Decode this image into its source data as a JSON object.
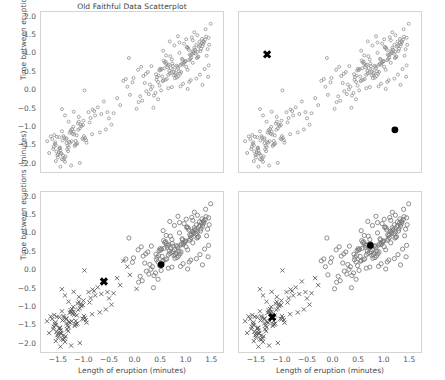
{
  "figure": {
    "title": "Old Faithful Data Scatterplot",
    "xlabel": "Length of eruption (minutes)",
    "ylabel": "Time between eruptions (minutes)"
  },
  "chart_data": {
    "type": "scatter",
    "title": "Old Faithful Data Scatterplot",
    "xlabel": "Length of eruption (minutes)",
    "ylabel": "Time between eruptions (minutes)",
    "xlim": [
      -1.85,
      1.75
    ],
    "ylim": [
      -2.25,
      2.15
    ],
    "xticks": [
      -1.5,
      -1.0,
      -0.5,
      0.0,
      0.5,
      1.0,
      1.5
    ],
    "yticks": [
      -2.0,
      -1.5,
      -1.0,
      -0.5,
      0.0,
      0.5,
      1.0,
      1.5,
      2.0
    ],
    "grid": false,
    "legend": "none",
    "layout": "2x2 small multiples (k-means progression)",
    "panels": [
      {
        "id": "panel-tl",
        "name": "raw-data",
        "show_xticklabels": false,
        "show_yticklabels": true,
        "title": "Old Faithful Data Scatterplot",
        "series": [
          {
            "name": "all points",
            "marker": "open-circle",
            "color": "#808080",
            "size": 2.0
          }
        ],
        "centroids": []
      },
      {
        "id": "panel-tr",
        "name": "initial-centroids",
        "show_xticklabels": false,
        "show_yticklabels": false,
        "series": [
          {
            "name": "all points",
            "marker": "open-circle",
            "color": "#808080",
            "size": 2.0
          }
        ],
        "centroids": [
          {
            "marker": "x",
            "color": "#000000",
            "x": -1.3,
            "y": 1.0
          },
          {
            "marker": "filled-circle",
            "color": "#000000",
            "x": 1.2,
            "y": -1.05
          }
        ]
      },
      {
        "id": "panel-bl",
        "name": "first-assignment",
        "show_xticklabels": true,
        "show_yticklabels": true,
        "series": [
          {
            "name": "cluster x",
            "marker": "x",
            "color": "#4d4d4d",
            "size": 2.6
          },
          {
            "name": "cluster o",
            "marker": "open-circle",
            "color": "#808080",
            "size": 2.6
          }
        ],
        "centroids": [
          {
            "marker": "x",
            "color": "#000000",
            "x": -0.62,
            "y": -0.28
          },
          {
            "marker": "filled-circle",
            "color": "#000000",
            "x": 0.5,
            "y": 0.18
          }
        ]
      },
      {
        "id": "panel-br",
        "name": "converged-clusters",
        "show_xticklabels": true,
        "show_yticklabels": false,
        "series": [
          {
            "name": "cluster x",
            "marker": "x",
            "color": "#4d4d4d",
            "size": 2.6
          },
          {
            "name": "cluster o",
            "marker": "open-circle",
            "color": "#808080",
            "size": 2.6
          }
        ],
        "centroids": [
          {
            "marker": "x",
            "color": "#000000",
            "x": -1.2,
            "y": -1.25
          },
          {
            "marker": "filled-circle",
            "color": "#000000",
            "x": 0.72,
            "y": 0.7
          }
        ]
      }
    ],
    "points": [
      [
        -1.49,
        -1.25
      ],
      [
        0.92,
        0.85
      ],
      [
        -0.36,
        -0.19
      ],
      [
        0.76,
        0.58
      ],
      [
        1.43,
        1.45
      ],
      [
        -0.97,
        -1.33
      ],
      [
        1.04,
        1.12
      ],
      [
        0.74,
        0.53
      ],
      [
        -1.51,
        -1.72
      ],
      [
        1.12,
        0.77
      ],
      [
        -1.35,
        -1.41
      ],
      [
        0.83,
        0.63
      ],
      [
        0.95,
        1.29
      ],
      [
        -1.48,
        -1.55
      ],
      [
        0.68,
        0.95
      ],
      [
        -1.2,
        -1.18
      ],
      [
        -1.44,
        -1.85
      ],
      [
        1.18,
        1.02
      ],
      [
        -1.55,
        -1.64
      ],
      [
        0.52,
        0.4
      ],
      [
        -1.41,
        -1.22
      ],
      [
        -1.33,
        -1.48
      ],
      [
        0.88,
        0.71
      ],
      [
        1.21,
        1.07
      ],
      [
        -1.02,
        -0.8
      ],
      [
        0.61,
        0.33
      ],
      [
        -1.38,
        -1.92
      ],
      [
        1.31,
        1.22
      ],
      [
        -1.57,
        -1.39
      ],
      [
        0.99,
        0.66
      ],
      [
        0.44,
        0.25
      ],
      [
        -1.12,
        -1.05
      ],
      [
        1.09,
        0.91
      ],
      [
        -1.46,
        -1.68
      ],
      [
        0.79,
        0.49
      ],
      [
        -0.67,
        -0.62
      ],
      [
        1.25,
        1.34
      ],
      [
        -1.29,
        -1.13
      ],
      [
        0.57,
        0.78
      ],
      [
        0.86,
        1.04
      ],
      [
        -1.52,
        -1.8
      ],
      [
        1.02,
        0.58
      ],
      [
        -1.18,
        -1.45
      ],
      [
        0.71,
        0.86
      ],
      [
        -1.4,
        -1.26
      ],
      [
        1.15,
        1.18
      ],
      [
        -1.07,
        -0.91
      ],
      [
        0.64,
        0.44
      ],
      [
        -1.61,
        -1.57
      ],
      [
        0.93,
        0.72
      ],
      [
        1.36,
        1.4
      ],
      [
        -1.25,
        -1.36
      ],
      [
        0.48,
        0.61
      ],
      [
        -1.44,
        -1.09
      ],
      [
        0.81,
        0.37
      ],
      [
        1.06,
        0.99
      ],
      [
        -1.53,
        -1.74
      ],
      [
        0.66,
        0.55
      ],
      [
        -0.88,
        -0.73
      ],
      [
        1.28,
        1.15
      ],
      [
        -1.31,
        -1.52
      ],
      [
        0.54,
        0.29
      ],
      [
        0.97,
        0.81
      ],
      [
        -1.15,
        -1.2
      ],
      [
        1.19,
        1.26
      ],
      [
        -1.47,
        -1.61
      ],
      [
        0.73,
        0.68
      ],
      [
        -1.22,
        -0.97
      ],
      [
        0.4,
        0.46
      ],
      [
        1.11,
        1.08
      ],
      [
        -1.58,
        -1.43
      ],
      [
        0.89,
        0.52
      ],
      [
        -1.04,
        -1.29
      ],
      [
        1.33,
        1.36
      ],
      [
        -1.37,
        -1.77
      ],
      [
        0.6,
        0.74
      ],
      [
        0.84,
        0.41
      ],
      [
        -1.26,
        -1.11
      ],
      [
        1.23,
        0.94
      ],
      [
        -1.5,
        -1.66
      ],
      [
        0.69,
        0.63
      ],
      [
        -0.92,
        -0.57
      ],
      [
        1.01,
        1.2
      ],
      [
        -1.43,
        -1.34
      ],
      [
        0.46,
        0.56
      ],
      [
        0.91,
        0.88
      ],
      [
        -1.19,
        -1.49
      ],
      [
        1.14,
        1.03
      ],
      [
        -1.54,
        -1.24
      ],
      [
        0.77,
        0.35
      ],
      [
        -1.09,
        -1.01
      ],
      [
        1.29,
        1.31
      ],
      [
        -1.34,
        -1.58
      ],
      [
        0.63,
        0.7
      ],
      [
        0.87,
        0.47
      ],
      [
        -1.23,
        -1.16
      ],
      [
        1.05,
        0.84
      ],
      [
        -1.45,
        -1.7
      ],
      [
        0.51,
        0.6
      ],
      [
        -0.79,
        -0.66
      ],
      [
        1.17,
        1.11
      ],
      [
        -1.3,
        -1.38
      ],
      [
        0.94,
        0.76
      ],
      [
        -1.13,
        -0.88
      ],
      [
        0.58,
        0.31
      ],
      [
        1.08,
        0.97
      ],
      [
        -1.56,
        -1.47
      ],
      [
        0.82,
        0.67
      ],
      [
        -1.01,
        -1.22
      ],
      [
        1.26,
        1.24
      ],
      [
        -1.39,
        -1.82
      ],
      [
        0.7,
        0.51
      ],
      [
        0.55,
        0.83
      ],
      [
        -1.27,
        -1.06
      ],
      [
        1.2,
        0.9
      ],
      [
        -1.48,
        -1.53
      ],
      [
        0.65,
        0.72
      ],
      [
        -0.84,
        -0.5
      ],
      [
        1.03,
        1.17
      ],
      [
        -1.36,
        -1.31
      ],
      [
        0.42,
        0.38
      ],
      [
        0.96,
        0.79
      ],
      [
        -1.16,
        -1.44
      ],
      [
        1.13,
        1.06
      ],
      [
        -1.59,
        -1.19
      ],
      [
        0.75,
        0.43
      ],
      [
        -1.06,
        -0.95
      ],
      [
        1.32,
        1.28
      ],
      [
        -1.32,
        -1.63
      ],
      [
        0.62,
        0.65
      ],
      [
        0.85,
        0.54
      ],
      [
        -1.21,
        -1.1
      ],
      [
        1.07,
        0.87
      ],
      [
        -1.42,
        -1.75
      ],
      [
        0.49,
        0.57
      ],
      [
        -0.74,
        -0.44
      ],
      [
        1.16,
        1.13
      ],
      [
        -1.28,
        -1.4
      ],
      [
        0.9,
        0.74
      ],
      [
        -1.11,
        -0.83
      ],
      [
        0.53,
        0.27
      ],
      [
        1.1,
        1.0
      ],
      [
        -1.6,
        -1.51
      ],
      [
        0.8,
        0.69
      ],
      [
        -0.99,
        -1.27
      ],
      [
        1.24,
        1.21
      ],
      [
        -1.41,
        -1.86
      ],
      [
        0.67,
        0.48
      ],
      [
        0.59,
        0.8
      ],
      [
        -1.24,
        -1.03
      ],
      [
        1.22,
        0.92
      ],
      [
        -1.49,
        -1.56
      ],
      [
        0.72,
        0.75
      ],
      [
        -0.81,
        -0.54
      ],
      [
        1.0,
        1.19
      ],
      [
        -1.35,
        -1.28
      ],
      [
        0.45,
        0.42
      ],
      [
        0.98,
        0.82
      ],
      [
        -1.14,
        -1.42
      ],
      [
        1.27,
        1.09
      ],
      [
        -1.03,
        -0.92
      ],
      [
        0.78,
        0.45
      ],
      [
        1.34,
        1.33
      ],
      [
        -1.17,
        -1.35
      ],
      [
        0.56,
        0.62
      ],
      [
        0.3,
        0.05
      ],
      [
        0.26,
        -0.08
      ],
      [
        0.18,
        0.22
      ],
      [
        -0.13,
        0.9
      ],
      [
        -0.11,
        -0.1
      ],
      [
        0.06,
        -0.3
      ],
      [
        -0.06,
        0.24
      ],
      [
        0.35,
        -0.45
      ],
      [
        -0.19,
        0.33
      ],
      [
        -0.55,
        -0.57
      ],
      [
        -0.62,
        -0.28
      ],
      [
        -1.0,
        0.02
      ],
      [
        -0.3,
        -0.38
      ],
      [
        0.13,
        -0.26
      ],
      [
        -0.43,
        -0.6
      ],
      [
        1.47,
        1.83
      ],
      [
        1.42,
        0.39
      ],
      [
        1.38,
        1.48
      ],
      [
        -1.63,
        -1.3
      ],
      [
        -1.26,
        -2.02
      ],
      [
        -1.09,
        -1.95
      ],
      [
        0.21,
        0.0
      ],
      [
        0.33,
        0.12
      ],
      [
        -0.52,
        -0.74
      ],
      [
        -1.02,
        -1.31
      ],
      [
        -0.85,
        -1.17
      ],
      [
        0.09,
        -0.14
      ],
      [
        1.39,
        0.96
      ],
      [
        1.3,
        1.42
      ],
      [
        -1.66,
        -1.23
      ],
      [
        1.12,
        1.38
      ],
      [
        0.86,
        1.32
      ],
      [
        0.47,
        0.15
      ],
      [
        0.39,
        -0.05
      ],
      [
        0.28,
        0.18
      ],
      [
        0.64,
        0.08
      ],
      [
        0.71,
        0.11
      ],
      [
        1.05,
        0.25
      ],
      [
        1.19,
        0.34
      ],
      [
        0.93,
        0.2
      ],
      [
        0.5,
        0.02
      ],
      [
        0.36,
        -0.12
      ],
      [
        -0.24,
        0.28
      ],
      [
        -0.04,
        0.36
      ],
      [
        0.15,
        0.41
      ],
      [
        1.41,
        1.14
      ],
      [
        1.35,
        0.6
      ],
      [
        1.08,
        0.3
      ],
      [
        -1.44,
        -0.49
      ],
      [
        -1.21,
        -0.56
      ],
      [
        -1.38,
        -0.66
      ],
      [
        -0.7,
        -1.12
      ],
      [
        -0.96,
        -1.4
      ],
      [
        -1.56,
        -1.9
      ],
      [
        0.24,
        0.52
      ],
      [
        0.41,
        0.31
      ],
      [
        0.88,
        0.13
      ],
      [
        1.26,
        0.45
      ],
      [
        -1.31,
        -0.83
      ],
      [
        -1.11,
        -0.7
      ],
      [
        -0.9,
        -0.85
      ],
      [
        0.02,
        -0.48
      ],
      [
        0.11,
        0.66
      ],
      [
        1.44,
        1.26
      ],
      [
        0.99,
        1.41
      ],
      [
        0.76,
        1.24
      ],
      [
        0.54,
        1.1
      ],
      [
        1.21,
        1.52
      ],
      [
        0.67,
        1.35
      ],
      [
        1.37,
        1.68
      ],
      [
        1.15,
        1.6
      ],
      [
        0.83,
        1.49
      ],
      [
        -1.73,
        -1.36
      ],
      [
        -1.69,
        -1.68
      ],
      [
        -1.47,
        -2.05
      ],
      [
        0.31,
        0.68
      ],
      [
        0.2,
        0.47
      ],
      [
        1.02,
        0.06
      ],
      [
        1.31,
        0.17
      ],
      [
        -0.58,
        -1.04
      ],
      [
        -0.47,
        -0.91
      ],
      [
        0.05,
        0.58
      ],
      [
        -0.16,
        0.12
      ],
      [
        0.44,
        -0.22
      ],
      [
        1.43,
        0.7
      ],
      [
        1.1,
        1.46
      ],
      [
        0.6,
        0.97
      ]
    ]
  }
}
